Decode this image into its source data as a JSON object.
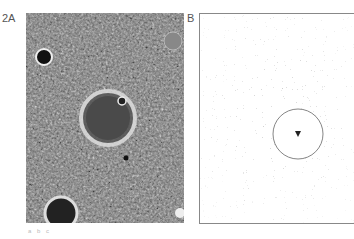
{
  "figure": {
    "panel_a": {
      "label": "2A",
      "description": "grayscale image of cratered planetary surface with central large crater"
    },
    "panel_b": {
      "label": "B",
      "description": "map of small crater outlines with central circular crater boundary and marked center point"
    },
    "caption": "a  b  c"
  }
}
